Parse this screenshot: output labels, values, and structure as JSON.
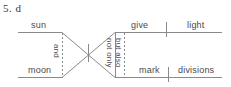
{
  "question": {
    "number": "5.",
    "answer": "d",
    "full_label": "5.  d"
  },
  "diagram": {
    "type": "sentence-diagram",
    "style": "Reed-Kellogg",
    "subjects": [
      {
        "id": "subject-1",
        "text": "sun",
        "position": "top-left"
      },
      {
        "id": "subject-2",
        "text": "moon",
        "position": "bottom-left"
      }
    ],
    "conjunctions": [
      {
        "id": "conj-and",
        "text": "and",
        "orientation": "vertical",
        "position": "left-connector"
      },
      {
        "id": "conj-not-only",
        "text": "not only",
        "orientation": "vertical",
        "position": "right-connector-solid"
      },
      {
        "id": "conj-but-also",
        "text": "but also",
        "orientation": "vertical",
        "position": "right-connector-dashed"
      }
    ],
    "predicates": [
      {
        "id": "verb-1",
        "text": "give",
        "object": "light",
        "position": "top-right"
      },
      {
        "id": "verb-2",
        "text": "mark",
        "object": "divisions",
        "position": "bottom-right"
      }
    ],
    "words": {
      "sun": "sun",
      "moon": "moon",
      "and": "and",
      "not_only": "not only",
      "but_also": "but also",
      "give": "give",
      "light": "light",
      "mark": "mark",
      "divisions": "divisions"
    },
    "colors": {
      "line": "#8a8a8a",
      "text": "#4a4a4a",
      "label": "#3a3a3a",
      "background": "#ffffff"
    }
  }
}
